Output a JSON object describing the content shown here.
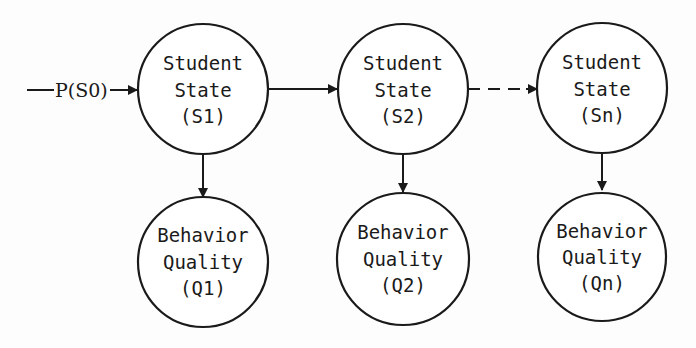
{
  "diagram": {
    "type": "state-transition / hidden-markov-style chain",
    "initial": {
      "label": "P(S0)"
    },
    "states": [
      {
        "id": "S1",
        "line1": "Student",
        "line2": "State",
        "line3": "(S1)"
      },
      {
        "id": "S2",
        "line1": "Student",
        "line2": "State",
        "line3": "(S2)"
      },
      {
        "id": "Sn",
        "line1": "Student",
        "line2": "State",
        "line3": "(Sn)"
      }
    ],
    "observations": [
      {
        "id": "Q1",
        "line1": "Behavior",
        "line2": "Quality",
        "line3": "(Q1)"
      },
      {
        "id": "Q2",
        "line1": "Behavior",
        "line2": "Quality",
        "line3": "(Q2)"
      },
      {
        "id": "Qn",
        "line1": "Behavior",
        "line2": "Quality",
        "line3": "(Qn)"
      }
    ],
    "edges": [
      {
        "from": "P(S0)",
        "to": "S1",
        "style": "solid"
      },
      {
        "from": "S1",
        "to": "S2",
        "style": "solid"
      },
      {
        "from": "S2",
        "to": "Sn",
        "style": "dashed"
      },
      {
        "from": "S1",
        "to": "Q1",
        "style": "solid"
      },
      {
        "from": "S2",
        "to": "Q2",
        "style": "solid"
      },
      {
        "from": "Sn",
        "to": "Qn",
        "style": "solid"
      }
    ],
    "colors": {
      "stroke": "#1a1a1a",
      "background": "#fdfdfd"
    }
  }
}
